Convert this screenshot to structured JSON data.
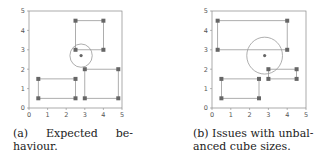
{
  "figures": [
    {
      "id": "a",
      "caption": {
        "label": "(a)",
        "line1_word1": "Expected",
        "line1_word2": "be-",
        "line2": "haviour."
      }
    },
    {
      "id": "b",
      "caption": {
        "line1": "(b) Issues with unbal-",
        "line2": "anced cube sizes."
      }
    }
  ],
  "colors": {
    "axis": "#888888",
    "edge": "#999999",
    "marker": "#666666",
    "circle": "#999999",
    "center": "#666666"
  },
  "chart_data": [
    {
      "type": "scatter",
      "title": "(a) Expected behaviour.",
      "xlim": [
        0,
        5
      ],
      "ylim": [
        0,
        5
      ],
      "xticks": [
        0,
        1,
        2,
        3,
        4,
        5
      ],
      "yticks": [
        0,
        1,
        2,
        3,
        4,
        5
      ],
      "grid": false,
      "rectangles": [
        {
          "x0": 2.5,
          "y0": 3.0,
          "x1": 4.0,
          "y1": 4.5
        },
        {
          "x0": 0.5,
          "y0": 0.5,
          "x1": 2.5,
          "y1": 1.5
        },
        {
          "x0": 3.0,
          "y0": 0.5,
          "x1": 4.8,
          "y1": 2.0
        }
      ],
      "circle": {
        "cx": 2.8,
        "cy": 2.7,
        "r": 0.6
      }
    },
    {
      "type": "scatter",
      "title": "(b) Issues with unbalanced cube sizes.",
      "xlim": [
        0,
        5
      ],
      "ylim": [
        0,
        5
      ],
      "xticks": [
        0,
        1,
        2,
        3,
        4,
        5
      ],
      "yticks": [
        0,
        1,
        2,
        3,
        4,
        5
      ],
      "grid": false,
      "rectangles": [
        {
          "x0": 0.3,
          "y0": 3.0,
          "x1": 4.0,
          "y1": 4.5
        },
        {
          "x0": 0.5,
          "y0": 0.5,
          "x1": 2.5,
          "y1": 1.5
        },
        {
          "x0": 3.0,
          "y0": 1.5,
          "x1": 4.5,
          "y1": 2.0
        }
      ],
      "circle": {
        "cx": 2.8,
        "cy": 2.7,
        "r": 0.95
      }
    }
  ]
}
